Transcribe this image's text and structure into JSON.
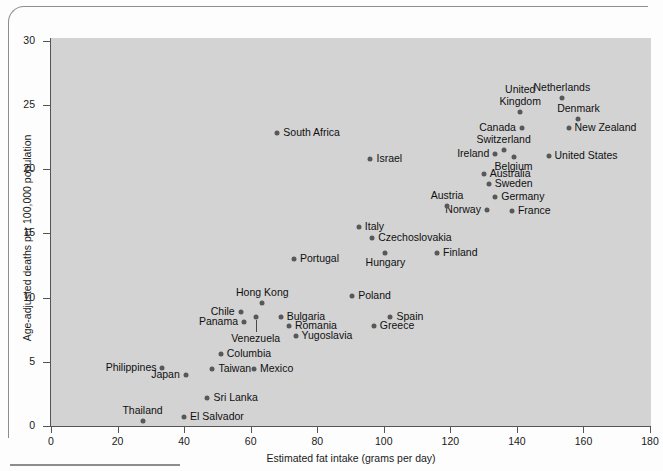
{
  "figure": {
    "background_color": "#d3d3d3",
    "point_color": "#585858",
    "axis_color": "#555555"
  },
  "chart_data": {
    "type": "scatter",
    "title": "",
    "xlabel": "Estimated fat intake (grams per day)",
    "ylabel": "Age-adjusted deaths per 100,000 population",
    "xlim": [
      0,
      180
    ],
    "ylim": [
      0,
      30
    ],
    "xticks": [
      0,
      20,
      40,
      60,
      80,
      100,
      120,
      140,
      160,
      180
    ],
    "yticks": [
      0,
      5,
      10,
      15,
      20,
      25,
      30
    ],
    "grid": false,
    "legend": "none",
    "points": [
      {
        "label": "Netherlands",
        "x": 153.5,
        "y": 25.5,
        "pos": "t"
      },
      {
        "label": "Denmark",
        "x": 158.5,
        "y": 23.9,
        "pos": "t"
      },
      {
        "label": "New Zealand",
        "x": 155.5,
        "y": 23.2,
        "pos": "r"
      },
      {
        "label": "United Kingdom",
        "x": 141.0,
        "y": 24.4,
        "pos": "t2"
      },
      {
        "label": "Canada",
        "x": 141.5,
        "y": 23.2,
        "pos": "l"
      },
      {
        "label": "Switzerland",
        "x": 136.0,
        "y": 21.5,
        "pos": "t"
      },
      {
        "label": "Ireland",
        "x": 133.5,
        "y": 21.2,
        "pos": "l"
      },
      {
        "label": "Belgium",
        "x": 139.0,
        "y": 20.9,
        "pos": "b"
      },
      {
        "label": "United States",
        "x": 149.5,
        "y": 21.0,
        "pos": "r"
      },
      {
        "label": "Australia",
        "x": 130.0,
        "y": 19.6,
        "pos": "r"
      },
      {
        "label": "Sweden",
        "x": 131.5,
        "y": 18.8,
        "pos": "r"
      },
      {
        "label": "Germany",
        "x": 133.5,
        "y": 17.8,
        "pos": "r"
      },
      {
        "label": "France",
        "x": 138.5,
        "y": 16.7,
        "pos": "r"
      },
      {
        "label": "Norway",
        "x": 131.0,
        "y": 16.8,
        "pos": "l"
      },
      {
        "label": "Austria",
        "x": 119.0,
        "y": 17.1,
        "pos": "t"
      },
      {
        "label": "Israel",
        "x": 96.0,
        "y": 20.8,
        "pos": "r"
      },
      {
        "label": "South Africa",
        "x": 68.0,
        "y": 22.8,
        "pos": "r"
      },
      {
        "label": "Italy",
        "x": 92.5,
        "y": 15.5,
        "pos": "r"
      },
      {
        "label": "Czechoslovakia",
        "x": 96.5,
        "y": 14.6,
        "pos": "r"
      },
      {
        "label": "Finland",
        "x": 116.0,
        "y": 13.5,
        "pos": "r"
      },
      {
        "label": "Hungary",
        "x": 100.5,
        "y": 13.5,
        "pos": "b"
      },
      {
        "label": "Portugal",
        "x": 73.0,
        "y": 13.0,
        "pos": "r"
      },
      {
        "label": "Poland",
        "x": 90.5,
        "y": 10.1,
        "pos": "r"
      },
      {
        "label": "Hong Kong",
        "x": 63.5,
        "y": 9.6,
        "pos": "t"
      },
      {
        "label": "Spain",
        "x": 102.0,
        "y": 8.5,
        "pos": "r"
      },
      {
        "label": "Greece",
        "x": 97.0,
        "y": 7.8,
        "pos": "r"
      },
      {
        "label": "Bulgaria",
        "x": 69.0,
        "y": 8.5,
        "pos": "r"
      },
      {
        "label": "Romania",
        "x": 71.5,
        "y": 7.8,
        "pos": "r"
      },
      {
        "label": "Yugoslavia",
        "x": 73.5,
        "y": 7.0,
        "pos": "r"
      },
      {
        "label": "Chile",
        "x": 57.0,
        "y": 8.9,
        "pos": "l"
      },
      {
        "label": "Panama",
        "x": 58.0,
        "y": 8.1,
        "pos": "l"
      },
      {
        "label": "Venezuela",
        "x": 61.5,
        "y": 8.5,
        "pos": "leader"
      },
      {
        "label": "Columbia",
        "x": 51.0,
        "y": 5.6,
        "pos": "r"
      },
      {
        "label": "Mexico",
        "x": 61.0,
        "y": 4.4,
        "pos": "r"
      },
      {
        "label": "Taiwan",
        "x": 48.5,
        "y": 4.4,
        "pos": "r"
      },
      {
        "label": "Japan",
        "x": 40.5,
        "y": 4.0,
        "pos": "l"
      },
      {
        "label": "Philippines",
        "x": 33.5,
        "y": 4.5,
        "pos": "l"
      },
      {
        "label": "Sri Lanka",
        "x": 47.0,
        "y": 2.2,
        "pos": "r"
      },
      {
        "label": "El Salvador",
        "x": 40.0,
        "y": 0.7,
        "pos": "r"
      },
      {
        "label": "Thailand",
        "x": 27.5,
        "y": 0.4,
        "pos": "t"
      }
    ]
  }
}
